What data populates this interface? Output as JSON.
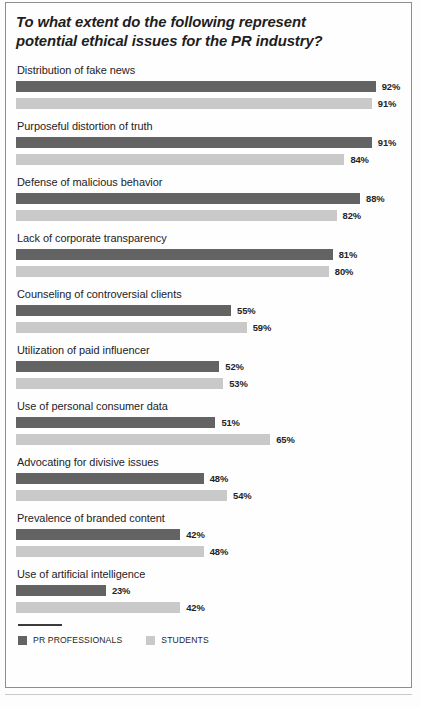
{
  "chart_data": {
    "type": "bar",
    "orientation": "horizontal",
    "title": "To what extent do the following represent potential ethical issues for the PR industry?",
    "xlabel": "",
    "ylabel": "",
    "xlim": [
      0,
      100
    ],
    "grid": false,
    "value_suffix": "%",
    "legend_position": "bottom-left",
    "categories": [
      "Distribution of fake news",
      "Purposeful distortion of truth",
      "Defense of malicious behavior",
      "Lack of corporate transparency",
      "Counseling of controversial clients",
      "Utilization of paid influencer",
      "Use of personal consumer data",
      "Advocating for divisive issues",
      "Prevalence of branded content",
      "Use of artificial intelligence"
    ],
    "series": [
      {
        "name": "PR PROFESSIONALS",
        "color": "#636363",
        "values": [
          92,
          91,
          88,
          81,
          55,
          52,
          51,
          48,
          42,
          23
        ],
        "labels": [
          "92%",
          "91%",
          "88%",
          "81%",
          "55%",
          "52%",
          "51%",
          "48%",
          "42%",
          "23%"
        ]
      },
      {
        "name": "STUDENTS",
        "color": "#c9c9c9",
        "values": [
          91,
          84,
          82,
          80,
          59,
          53,
          65,
          54,
          48,
          42
        ],
        "labels": [
          "91%",
          "84%",
          "82%",
          "80%",
          "59%",
          "53%",
          "65%",
          "54%",
          "48%",
          "42%"
        ]
      }
    ]
  },
  "legend": {
    "items": [
      {
        "label": "PR PROFESSIONALS",
        "color": "#636363"
      },
      {
        "label": "STUDENTS",
        "color": "#c9c9c9"
      }
    ]
  },
  "colors": {
    "pr_professionals": "#636363",
    "students": "#c9c9c9",
    "frame": "#8d8d8d",
    "text": "#23221f",
    "background": "#fefefe"
  }
}
